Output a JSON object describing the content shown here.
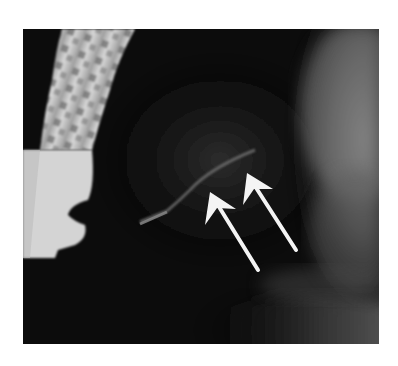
{
  "figure": {
    "type": "radiograph",
    "annotations": [
      {
        "kind": "arrow",
        "color": "#ffffff",
        "tip": [
          210,
          192
        ],
        "tail": [
          258,
          270
        ]
      },
      {
        "kind": "arrow",
        "color": "#ffffff",
        "tip": [
          247,
          173
        ],
        "tail": [
          296,
          250
        ]
      }
    ]
  }
}
